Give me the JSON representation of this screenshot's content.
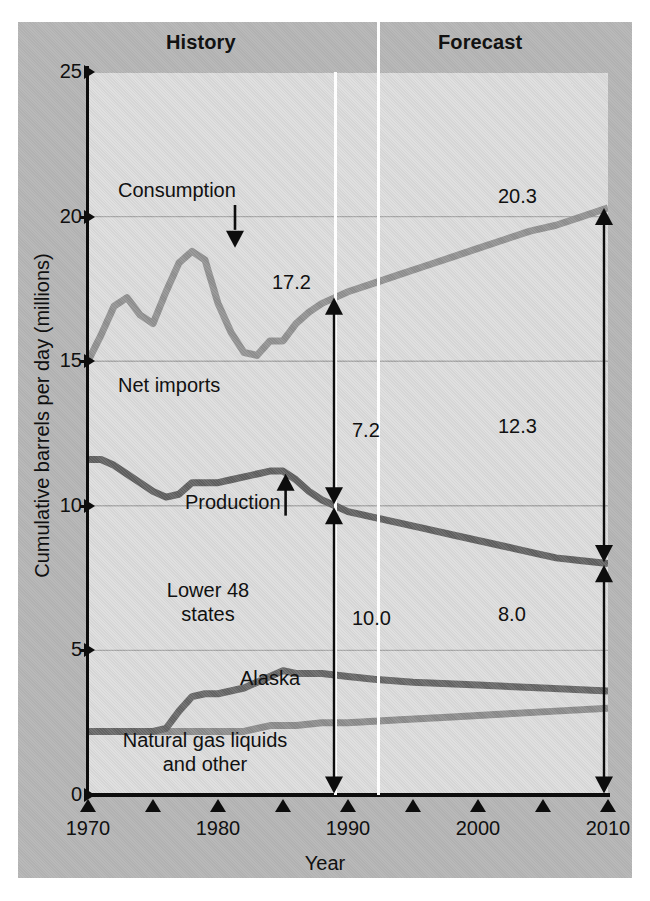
{
  "figure": {
    "bands": {
      "history": "History",
      "forecast": "Forecast"
    },
    "y_axis_title": "Cumulative barrels per day (millions)",
    "x_axis_title": "Year",
    "colors": {
      "figure_bg": "#b6b6b6",
      "plot_bg": "#dcdcdc",
      "axis": "#0d0d0d",
      "gridline": "#a8a8a8",
      "consumption_line": "#919191",
      "production_line": "#616161",
      "alaska_line": "#666666",
      "ngl_line": "#8c8c8c",
      "divider": "#fdfdfd"
    },
    "annotations": {
      "consumption": "Consumption",
      "net_imports": "Net imports",
      "production": "Production",
      "lower48_line1": "Lower 48",
      "lower48_line2": "states",
      "alaska": "Alaska",
      "ngl_line1": "Natural gas liquids",
      "ngl_line2": "and other",
      "value_1989_consumption": "17.2",
      "value_2010_consumption": "20.3",
      "value_1989_net_imports": "7.2",
      "value_2010_net_imports": "12.3",
      "value_1989_production": "10.0",
      "value_2010_production": "8.0"
    }
  },
  "chart_data": {
    "type": "line",
    "title": "",
    "xlabel": "Year",
    "ylabel": "Cumulative barrels per day (millions)",
    "xlim": [
      1970,
      2010
    ],
    "ylim": [
      0,
      25
    ],
    "xticks": [
      1970,
      1975,
      1980,
      1985,
      1990,
      1995,
      2000,
      2005,
      2010
    ],
    "xtick_labels": [
      "1970",
      "",
      "1980",
      "",
      "1990",
      "",
      "2000",
      "",
      "2010"
    ],
    "yticks": [
      0,
      5,
      10,
      15,
      20,
      25
    ],
    "ytick_labels": [
      "0",
      "5",
      "10",
      "15",
      "20",
      "25"
    ],
    "grid": "horizontal",
    "legend_position": "inline-annotations",
    "history_forecast_split_year": 1989,
    "series": [
      {
        "name": "Consumption",
        "color": "#919191",
        "x": [
          1970,
          1971,
          1972,
          1973,
          1974,
          1975,
          1976,
          1977,
          1978,
          1979,
          1980,
          1981,
          1982,
          1983,
          1984,
          1985,
          1986,
          1987,
          1988,
          1989,
          1990,
          1992,
          1994,
          1996,
          1998,
          2000,
          2002,
          2004,
          2006,
          2008,
          2010
        ],
        "values": [
          15.0,
          15.9,
          16.9,
          17.2,
          16.6,
          16.3,
          17.4,
          18.4,
          18.8,
          18.5,
          17.0,
          16.0,
          15.3,
          15.2,
          15.7,
          15.7,
          16.3,
          16.7,
          17.0,
          17.2,
          17.4,
          17.7,
          18.0,
          18.3,
          18.6,
          18.9,
          19.2,
          19.5,
          19.7,
          20.0,
          20.3
        ]
      },
      {
        "name": "Production",
        "color": "#616161",
        "x": [
          1970,
          1971,
          1972,
          1973,
          1974,
          1975,
          1976,
          1977,
          1978,
          1979,
          1980,
          1981,
          1982,
          1983,
          1984,
          1985,
          1986,
          1987,
          1988,
          1989,
          1990,
          1992,
          1994,
          1996,
          1998,
          2000,
          2002,
          2004,
          2006,
          2008,
          2010
        ],
        "values": [
          11.6,
          11.6,
          11.4,
          11.1,
          10.8,
          10.5,
          10.3,
          10.4,
          10.8,
          10.8,
          10.8,
          10.9,
          11.0,
          11.1,
          11.2,
          11.2,
          10.9,
          10.5,
          10.2,
          10.0,
          9.8,
          9.6,
          9.4,
          9.2,
          9.0,
          8.8,
          8.6,
          8.4,
          8.2,
          8.1,
          8.0
        ]
      },
      {
        "name": "Alaska (upper bound of Lower 48 + Alaska)",
        "color": "#666666",
        "x": [
          1970,
          1972,
          1974,
          1975,
          1976,
          1977,
          1978,
          1979,
          1980,
          1982,
          1984,
          1985,
          1986,
          1987,
          1988,
          1990,
          1992,
          1995,
          2000,
          2005,
          2010
        ],
        "values": [
          2.2,
          2.2,
          2.2,
          2.2,
          2.3,
          2.9,
          3.4,
          3.5,
          3.5,
          3.7,
          4.1,
          4.3,
          4.2,
          4.2,
          4.2,
          4.1,
          4.0,
          3.9,
          3.8,
          3.7,
          3.6
        ]
      },
      {
        "name": "Natural gas liquids and other",
        "color": "#8c8c8c",
        "x": [
          1970,
          1974,
          1978,
          1982,
          1984,
          1986,
          1988,
          1990,
          1994,
          1998,
          2002,
          2006,
          2010
        ],
        "values": [
          2.2,
          2.2,
          2.2,
          2.2,
          2.4,
          2.4,
          2.5,
          2.5,
          2.6,
          2.7,
          2.8,
          2.9,
          3.0
        ]
      }
    ],
    "value_labels": [
      {
        "label": "17.2",
        "year": 1989,
        "series": "Consumption",
        "value": 17.2
      },
      {
        "label": "20.3",
        "year": 2010,
        "series": "Consumption",
        "value": 20.3
      },
      {
        "label": "7.2",
        "year": 1989,
        "series": "Net imports",
        "value": 7.2
      },
      {
        "label": "12.3",
        "year": 2010,
        "series": "Net imports",
        "value": 12.3
      },
      {
        "label": "10.0",
        "year": 1989,
        "series": "Production",
        "value": 10.0
      },
      {
        "label": "8.0",
        "year": 2010,
        "series": "Production",
        "value": 8.0
      }
    ]
  }
}
